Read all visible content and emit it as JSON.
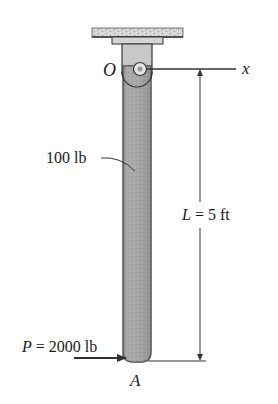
{
  "diagram": {
    "type": "pendulum-rod-free-body",
    "labels": {
      "pivot": "O",
      "axis": "x",
      "weight": "100 lb",
      "length_var": "L",
      "length_eq": " = 5 ft",
      "force_var": "P",
      "force_eq": " = 2000 lb",
      "end_point": "A"
    },
    "colors": {
      "rod_fill": "#a9a9a9",
      "rod_edge": "#4a4a4a",
      "ceiling_fill": "#d6d6d6",
      "line": "#333333",
      "text": "#1a1a1a"
    }
  }
}
